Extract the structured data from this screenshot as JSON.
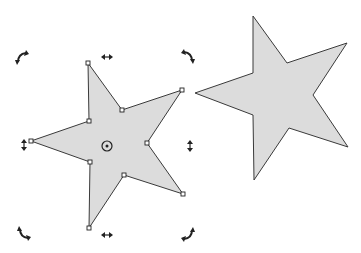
{
  "diagram": {
    "title": "Star shapes: selected with rotate handles vs. transformed copy",
    "colors": {
      "background": "#ffffff",
      "fill": "#dcdcdc",
      "stroke": "#3a3a3a",
      "handle": "#222222"
    },
    "selected_star": {
      "points": "88,63 122,110 182,90 147,143 183,194 124,175 89,228 90,162 31,141 89,121",
      "nodes": [
        [
          88,
          63
        ],
        [
          122,
          110
        ],
        [
          182,
          90
        ],
        [
          147,
          143
        ],
        [
          183,
          194
        ],
        [
          124,
          175
        ],
        [
          89,
          228
        ],
        [
          90,
          162
        ],
        [
          31,
          141
        ],
        [
          89,
          121
        ]
      ],
      "center": [
        107,
        146
      ]
    },
    "copy_star": {
      "points": "253,16 287,63 347,43 313,95 348,147 289,128 254,180 253,115 195,93 253,73"
    },
    "handles": {
      "rotate_top_left": [
        21,
        57
      ],
      "rotate_top_right": [
        189,
        56
      ],
      "rotate_bottom_left": [
        23,
        234
      ],
      "rotate_bottom_right": [
        189,
        235
      ],
      "skew_top": [
        107,
        57
      ],
      "skew_bottom": [
        107,
        235
      ],
      "skew_left": [
        24,
        145
      ],
      "skew_right": [
        190,
        146
      ]
    }
  }
}
